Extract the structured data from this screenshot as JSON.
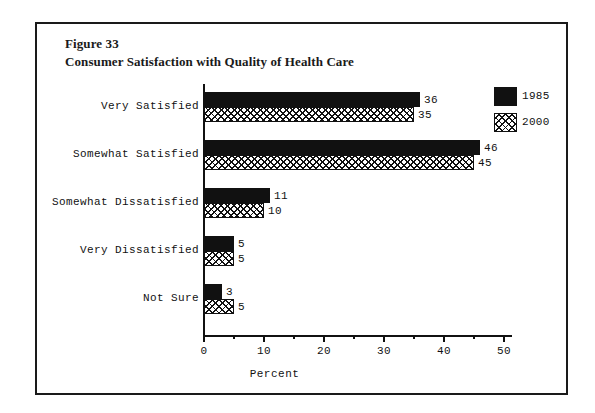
{
  "figure": {
    "number": "Figure 33",
    "title": "Consumer Satisfaction with Quality of Health Care"
  },
  "chart_data": {
    "type": "bar",
    "orientation": "horizontal",
    "title": "Consumer Satisfaction with Quality of Health Care",
    "subtitle": "Figure 33",
    "xlabel": "Percent",
    "ylabel": "",
    "xlim": [
      0,
      50
    ],
    "xticks": [
      0,
      10,
      20,
      30,
      40,
      50
    ],
    "xtick_labels": [
      "0",
      "10",
      "20",
      "30",
      "40",
      "50"
    ],
    "xminorticks": [
      5,
      15,
      25,
      35,
      45
    ],
    "grid": false,
    "legend_position": "upper-right-outside",
    "categories": [
      "Very Satisfied",
      "Somewhat Satisfied",
      "Somewhat Dissatisfied",
      "Very Dissatisfied",
      "Not Sure"
    ],
    "series": [
      {
        "name": "1985",
        "fill": "solid-black",
        "color": "#111111",
        "values": [
          36,
          46,
          11,
          5,
          3
        ],
        "value_labels": [
          "36",
          "46",
          "11",
          "5",
          "3"
        ]
      },
      {
        "name": "2000",
        "fill": "crosshatch",
        "color": "#111111",
        "values": [
          35,
          45,
          10,
          5,
          5
        ],
        "value_labels": [
          "35",
          "45",
          "10",
          "5",
          "5"
        ]
      }
    ]
  },
  "legend": {
    "items": [
      {
        "label": "1985",
        "fill": "solid"
      },
      {
        "label": "2000",
        "fill": "hatch"
      }
    ]
  }
}
